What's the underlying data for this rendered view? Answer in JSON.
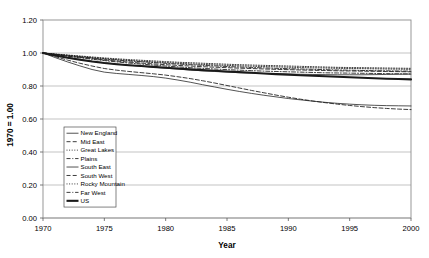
{
  "figure": {
    "clipped_header_text": " ",
    "background_color": "#ffffff",
    "axis_color": "#808080",
    "line_color": "#1a1a1a"
  },
  "chart_data": {
    "type": "line",
    "title": "",
    "xlabel": "Year",
    "ylabel": "1970 = 1.00",
    "xlim": [
      1970,
      2000
    ],
    "ylim": [
      0.0,
      1.2
    ],
    "xticks": [
      1970,
      1975,
      1980,
      1985,
      1990,
      1995,
      2000
    ],
    "xtick_labels": [
      "1970",
      "1975",
      "1980",
      "1985",
      "1990",
      "1995",
      "2000"
    ],
    "yticks": [
      0.0,
      0.2,
      0.4,
      0.6,
      0.8,
      1.0,
      1.2
    ],
    "ytick_labels": [
      "0.00",
      "0.20",
      "0.40",
      "0.60",
      "0.80",
      "1.00",
      "1.20"
    ],
    "grid": "horizontal",
    "legend_position": "lower-left-inside",
    "x": [
      1970,
      1971,
      1972,
      1973,
      1974,
      1975,
      1976,
      1977,
      1978,
      1979,
      1980,
      1981,
      1982,
      1983,
      1984,
      1985,
      1986,
      1987,
      1988,
      1989,
      1990,
      1991,
      1992,
      1993,
      1994,
      1995,
      1996,
      1997,
      1998,
      1999,
      2000
    ],
    "series": [
      {
        "name": "New England",
        "style": "solid-thin",
        "values": [
          1.0,
          0.986,
          0.973,
          0.962,
          0.95,
          0.941,
          0.933,
          0.926,
          0.92,
          0.914,
          0.908,
          0.902,
          0.897,
          0.892,
          0.888,
          0.884,
          0.881,
          0.878,
          0.876,
          0.874,
          0.872,
          0.871,
          0.87,
          0.869,
          0.868,
          0.868,
          0.868,
          0.869,
          0.87,
          0.871,
          0.872
        ]
      },
      {
        "name": "Mid East",
        "style": "dashed",
        "values": [
          1.0,
          0.991,
          0.982,
          0.974,
          0.966,
          0.958,
          0.951,
          0.945,
          0.939,
          0.934,
          0.929,
          0.925,
          0.921,
          0.917,
          0.914,
          0.911,
          0.908,
          0.906,
          0.903,
          0.901,
          0.899,
          0.897,
          0.895,
          0.894,
          0.892,
          0.891,
          0.89,
          0.889,
          0.888,
          0.887,
          0.886
        ]
      },
      {
        "name": "Great Lakes",
        "style": "dotted",
        "values": [
          1.0,
          0.993,
          0.986,
          0.979,
          0.972,
          0.966,
          0.96,
          0.955,
          0.95,
          0.946,
          0.942,
          0.938,
          0.934,
          0.931,
          0.928,
          0.925,
          0.922,
          0.92,
          0.918,
          0.916,
          0.914,
          0.912,
          0.91,
          0.909,
          0.907,
          0.906,
          0.905,
          0.904,
          0.903,
          0.902,
          0.901
        ]
      },
      {
        "name": "Plains",
        "style": "dash-dot",
        "values": [
          1.0,
          0.99,
          0.98,
          0.971,
          0.962,
          0.954,
          0.946,
          0.939,
          0.933,
          0.927,
          0.921,
          0.916,
          0.911,
          0.907,
          0.903,
          0.899,
          0.896,
          0.893,
          0.89,
          0.888,
          0.886,
          0.884,
          0.882,
          0.88,
          0.879,
          0.878,
          0.877,
          0.876,
          0.875,
          0.874,
          0.873
        ]
      },
      {
        "name": "South East",
        "style": "solid-thin",
        "values": [
          1.0,
          0.972,
          0.946,
          0.922,
          0.9,
          0.884,
          0.876,
          0.87,
          0.864,
          0.857,
          0.848,
          0.836,
          0.823,
          0.808,
          0.794,
          0.78,
          0.767,
          0.755,
          0.744,
          0.734,
          0.724,
          0.716,
          0.708,
          0.701,
          0.695,
          0.69,
          0.686,
          0.683,
          0.681,
          0.68,
          0.679
        ]
      },
      {
        "name": "South West",
        "style": "dashed",
        "values": [
          1.0,
          0.978,
          0.957,
          0.938,
          0.921,
          0.906,
          0.896,
          0.888,
          0.881,
          0.874,
          0.866,
          0.856,
          0.845,
          0.832,
          0.818,
          0.803,
          0.788,
          0.773,
          0.759,
          0.745,
          0.732,
          0.72,
          0.709,
          0.699,
          0.69,
          0.682,
          0.675,
          0.669,
          0.664,
          0.66,
          0.657
        ]
      },
      {
        "name": "Rocky Mountain",
        "style": "dotted",
        "values": [
          1.0,
          0.994,
          0.988,
          0.982,
          0.976,
          0.97,
          0.965,
          0.96,
          0.956,
          0.952,
          0.948,
          0.944,
          0.941,
          0.938,
          0.935,
          0.932,
          0.929,
          0.927,
          0.925,
          0.923,
          0.921,
          0.919,
          0.917,
          0.915,
          0.913,
          0.912,
          0.911,
          0.91,
          0.909,
          0.908,
          0.907
        ]
      },
      {
        "name": "Far West",
        "style": "dash-dot",
        "values": [
          1.0,
          0.992,
          0.984,
          0.977,
          0.97,
          0.963,
          0.957,
          0.952,
          0.947,
          0.942,
          0.937,
          0.933,
          0.929,
          0.925,
          0.922,
          0.918,
          0.915,
          0.912,
          0.91,
          0.907,
          0.905,
          0.903,
          0.901,
          0.899,
          0.897,
          0.896,
          0.894,
          0.893,
          0.892,
          0.891,
          0.89
        ]
      },
      {
        "name": "US",
        "style": "bold-solid",
        "values": [
          1.0,
          0.985,
          0.971,
          0.959,
          0.948,
          0.939,
          0.932,
          0.926,
          0.921,
          0.916,
          0.911,
          0.906,
          0.901,
          0.896,
          0.892,
          0.888,
          0.884,
          0.88,
          0.876,
          0.872,
          0.869,
          0.865,
          0.862,
          0.859,
          0.856,
          0.853,
          0.85,
          0.847,
          0.844,
          0.842,
          0.84
        ]
      }
    ]
  }
}
